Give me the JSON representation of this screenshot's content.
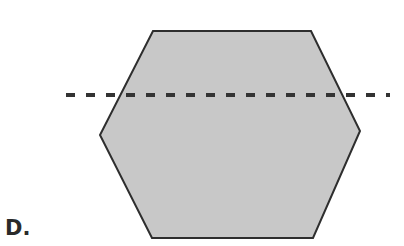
{
  "figure": {
    "label": "D.",
    "shape": "hexagon",
    "fill_color": "#c8c8c8",
    "stroke_color": "#2e2e2e",
    "vertices": [
      [
        153,
        31
      ],
      [
        311,
        31
      ],
      [
        360,
        131
      ],
      [
        313,
        238
      ],
      [
        152,
        238
      ],
      [
        100,
        135
      ]
    ],
    "dashed_line": {
      "x1": 66,
      "x2": 390,
      "y": 95,
      "color": "#333333"
    }
  }
}
